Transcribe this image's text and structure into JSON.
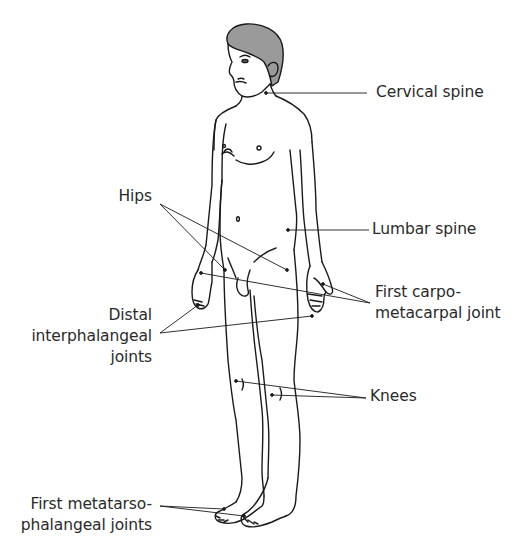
{
  "diagram": {
    "type": "anatomical-illustration",
    "colors": {
      "line": "#1a1a1a",
      "hair": "#9a9a9a",
      "text": "#2a2a2a",
      "background": "#ffffff"
    },
    "labels": {
      "cervical_spine": {
        "lines": [
          "Cervical spine"
        ]
      },
      "hips": {
        "lines": [
          "Hips"
        ]
      },
      "lumbar_spine": {
        "lines": [
          "Lumbar spine"
        ]
      },
      "first_cmc": {
        "lines": [
          "First carpo-",
          "metacarpal joint"
        ]
      },
      "dip": {
        "lines": [
          "Distal",
          "interphalangeal",
          "joints"
        ]
      },
      "knees": {
        "lines": [
          "Knees"
        ]
      },
      "first_mtp": {
        "lines": [
          "First metatarso-",
          "phalangeal joints"
        ]
      }
    },
    "caption_partial": ""
  }
}
